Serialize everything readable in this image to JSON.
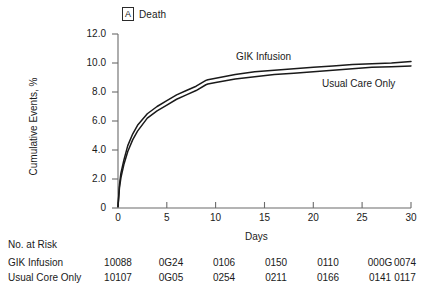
{
  "panel": {
    "tag": "A",
    "title": "Death"
  },
  "chart_data": {
    "type": "line",
    "title": "Death",
    "xlabel": "Days",
    "ylabel": "Cumulative Events, %",
    "xlim": [
      0,
      30
    ],
    "ylim": [
      0,
      12
    ],
    "xticks": [
      "0",
      "5",
      "10",
      "15",
      "20",
      "25",
      "30"
    ],
    "yticks": [
      "12.0",
      "10.0",
      "8.0",
      "6.0",
      "4.0",
      "2.0",
      "0"
    ],
    "grid": false,
    "legend_position": "inline-annotations",
    "series": [
      {
        "name": "GIK Infusion",
        "label_position": "upper-curve",
        "x": [
          0,
          0.15,
          0.3,
          0.6,
          1,
          1.5,
          2,
          3,
          4,
          5,
          6,
          7,
          8,
          9,
          9.2,
          10,
          12,
          14,
          16,
          18,
          20,
          22,
          24,
          26,
          28,
          30
        ],
        "y": [
          0.1,
          1.6,
          2.4,
          3.3,
          4.3,
          5.1,
          5.7,
          6.5,
          7.0,
          7.4,
          7.8,
          8.1,
          8.4,
          8.8,
          8.85,
          8.95,
          9.2,
          9.4,
          9.5,
          9.6,
          9.7,
          9.8,
          9.9,
          9.95,
          10.0,
          10.1
        ]
      },
      {
        "name": "Usual Care Only",
        "label_position": "lower-curve",
        "x": [
          0,
          0.15,
          0.3,
          0.6,
          1,
          1.5,
          2,
          3,
          4,
          5,
          6,
          7,
          8,
          9,
          9.2,
          10,
          12,
          14,
          16,
          18,
          20,
          22,
          24,
          26,
          28,
          30
        ],
        "y": [
          0.1,
          1.4,
          2.1,
          3.0,
          3.9,
          4.7,
          5.3,
          6.2,
          6.7,
          7.1,
          7.5,
          7.8,
          8.1,
          8.5,
          8.55,
          8.65,
          8.9,
          9.05,
          9.2,
          9.3,
          9.4,
          9.5,
          9.6,
          9.7,
          9.75,
          9.8
        ]
      }
    ],
    "annotations": [
      {
        "text": "GIK Infusion",
        "x": 17.5,
        "y": 10.9
      },
      {
        "text": "Usual Care Only",
        "x": 25.5,
        "y": 8.6
      }
    ]
  },
  "risk_table": {
    "heading": "No. at Risk",
    "columns": [
      "0",
      "5",
      "10",
      "15",
      "20",
      "25",
      "30"
    ],
    "rows": [
      {
        "label": "GIK Infusion",
        "values": [
          "10088",
          "0G24",
          "0106",
          "0150",
          "0110",
          "000G",
          "0074"
        ]
      },
      {
        "label": "Usual Core Only",
        "values": [
          "10107",
          "0G05",
          "0254",
          "0211",
          "0166",
          "0141",
          "0117"
        ]
      }
    ]
  },
  "colors": {
    "axis": "#6b6b6b",
    "curve": "#1a1a1a",
    "text": "#1a1a1a"
  }
}
